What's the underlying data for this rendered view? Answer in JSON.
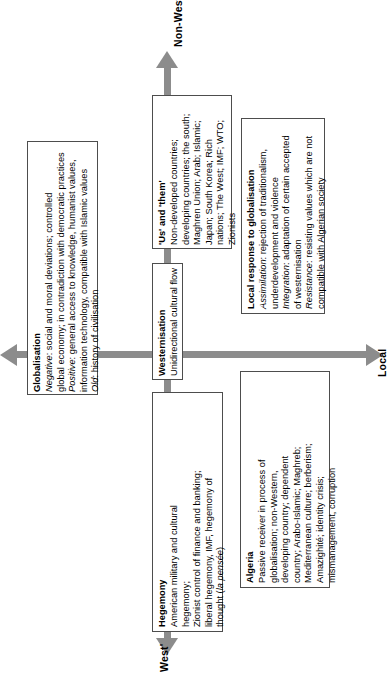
{
  "diagram": {
    "accent_color": "#8c8c8c",
    "border_color": "#4d4d4d",
    "axes": {
      "vertical_top_label": "Non-West",
      "vertical_bottom_label": "West'",
      "horizontal_right_label": "Local",
      "horizontal_left_label": ""
    },
    "boxes": [
      {
        "id": "globalisation",
        "title": "Globalisation",
        "lines": [
          "Negative: social and moral deviations; controlled",
          "global economy; in contradiction with democratic practices",
          "Positive: general access to knowledge, humanist values,",
          "information technology, compatible with Islamic values",
          "Old: history of civilisation"
        ],
        "italic_leads": [
          "Negative",
          "Positive",
          "Old"
        ]
      },
      {
        "id": "us-and-them",
        "title": "'Us' and 'them'",
        "lines": [
          "Non-developed countries;",
          "developing countries; the south;",
          "Maghren Union; Arab; Islamic;",
          "Japan; South Korea; Rich",
          "nations; The West; IMF; WTO;",
          "Zionists"
        ],
        "italic_leads": []
      },
      {
        "id": "westernisation",
        "title": "Westernisation",
        "lines": [
          "Unidirectional cultural flow"
        ],
        "italic_leads": []
      },
      {
        "id": "hegemony",
        "title": "Hegemony",
        "lines": [
          "American military and cultural",
          "hegemony;",
          "Zionist control of finance and banking;",
          "liberal hegemony, IMF, hegemony of",
          "thought (la pensée)"
        ],
        "italic_leads": []
      },
      {
        "id": "algeria",
        "title": "Algeria",
        "lines": [
          "Passive receiver in process of",
          "globalisation; non-Western,",
          "developing country; dependent",
          "country; Arabo-Islamic; Maghreb;",
          "Mediterranean culture; berberism;",
          "Amazighité; identity crisis;",
          "mismanagement, corruption"
        ],
        "italic_leads": []
      },
      {
        "id": "local-response",
        "title": "Local response to globalisation",
        "lines": [
          "Assimilation: rejection of traditionalism,",
          "underdevelopment and violence",
          "Integration: adaptation of certain accepted",
          "of westernisation",
          "Resistance: resisting values which are not",
          "compatible with Algerian society"
        ],
        "italic_leads": [
          "Assimilation",
          "Integration",
          "Resistance"
        ]
      }
    ]
  }
}
